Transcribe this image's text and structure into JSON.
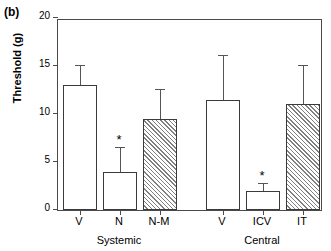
{
  "panel": {
    "label": "(b)"
  },
  "chart_data": {
    "type": "bar",
    "title": "",
    "subtitle": "",
    "xlabel": "",
    "ylabel": "Threshold (g)",
    "ylim": [
      0,
      20
    ],
    "yticks": [
      0,
      5,
      10,
      15,
      20
    ],
    "ytick_labels": [
      "0",
      "5",
      "10",
      "15",
      "20"
    ],
    "grid": false,
    "legend": null,
    "categories": [
      "V",
      "N",
      "N-M",
      "V",
      "ICV",
      "IT"
    ],
    "values": [
      13.0,
      4.0,
      9.5,
      11.5,
      2.0,
      11.0
    ],
    "errors": [
      2.0,
      2.5,
      3.0,
      4.5,
      0.7,
      4.0
    ],
    "fills": [
      "open",
      "open",
      "hatched",
      "open",
      "open",
      "hatched"
    ],
    "annotations": [
      {
        "category": "N",
        "text": "*"
      },
      {
        "category": "ICV",
        "text": "*"
      }
    ],
    "groups": [
      {
        "label": "Systemic",
        "categories": [
          "V",
          "N",
          "N-M"
        ]
      },
      {
        "label": "Central",
        "categories": [
          "V",
          "ICV",
          "IT"
        ]
      }
    ],
    "series": [
      {
        "name": "Threshold",
        "values": [
          13.0,
          4.0,
          9.5,
          11.5,
          2.0,
          11.0
        ],
        "errors": [
          2.0,
          2.5,
          3.0,
          4.5,
          0.7,
          4.0
        ]
      }
    ]
  },
  "axis_colors": {
    "frame": "#4a4a4a",
    "bar_edge": "#3a3a3a",
    "error": "#555555",
    "hatch": "#808080",
    "text": "#000000"
  }
}
